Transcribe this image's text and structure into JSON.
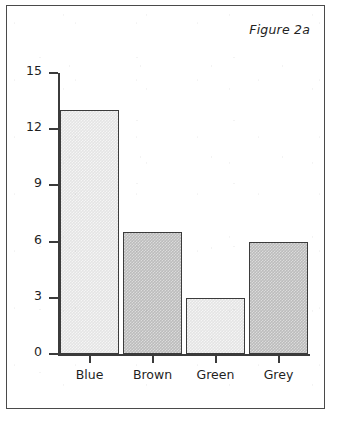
{
  "figure": {
    "caption": "Figure 2a"
  },
  "chart_data": {
    "type": "bar",
    "title": "Figure 2a",
    "xlabel": "",
    "ylabel": "",
    "categories": [
      "Blue",
      "Brown",
      "Green",
      "Grey"
    ],
    "values": [
      13,
      6.5,
      3,
      6
    ],
    "bar_styles": [
      "light",
      "dark",
      "light",
      "dark"
    ],
    "ylim": [
      0,
      15
    ],
    "y_ticks": [
      0,
      3,
      6,
      9,
      12,
      15
    ],
    "y_tick_labels": [
      "0",
      "3",
      "6",
      "9",
      "12",
      "15"
    ],
    "grid": false,
    "legend": false,
    "colors": {
      "bar_light": "#e4e4e4",
      "bar_dark": "#bcbcbc",
      "bar_outline": "#3b3b3b",
      "axis": "#3b3b3b",
      "frame": "#4a4a4a",
      "text": "#1f1f1f",
      "background": "#ffffff"
    }
  }
}
